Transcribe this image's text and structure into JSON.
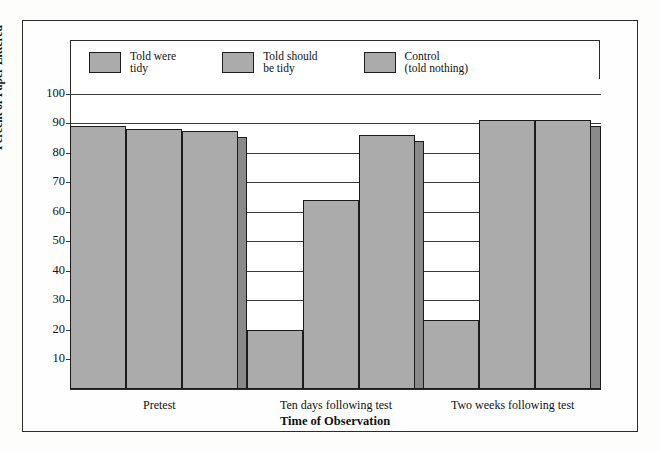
{
  "chart_data": {
    "type": "bar",
    "title": "",
    "xlabel": "Time of Observation",
    "ylabel": "Percent of Paper Littered",
    "categories": [
      "Pretest",
      "Ten days following test",
      "Two weeks following test"
    ],
    "series": [
      {
        "name": "Told were tidy",
        "values": [
          89,
          20,
          23.5
        ]
      },
      {
        "name": "Told should be tidy",
        "values": [
          88,
          64,
          91
        ]
      },
      {
        "name": "Control (told nothing)",
        "values": [
          87.5,
          86,
          91
        ]
      }
    ],
    "ylim": [
      0,
      105
    ],
    "yticks": [
      10,
      20,
      30,
      40,
      50,
      60,
      70,
      80,
      90,
      100
    ],
    "grid": true,
    "legend_position": "top",
    "bar_fill_color": "#ababab",
    "bar_side_color": "#8a8a8a",
    "bar_border_color": "#1b1b1b",
    "axis_color": "#2b2b2b",
    "background_color": "#ffffff"
  },
  "legend": {
    "items": [
      {
        "label": "Told were\ntidy"
      },
      {
        "label": "Told should\nbe tidy"
      },
      {
        "label": "Control\n(told nothing)"
      }
    ]
  },
  "axes": {
    "y_title": "Percent of Paper Littered",
    "x_title": "Time of Observation",
    "y_ticks": [
      "100",
      "90",
      "80",
      "70",
      "60",
      "50",
      "40",
      "30",
      "20",
      "10"
    ],
    "x_ticks": [
      "Pretest",
      "Ten days following test",
      "Two weeks following test"
    ]
  }
}
